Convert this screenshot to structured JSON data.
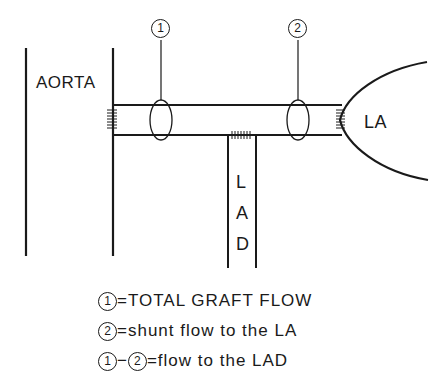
{
  "diagram": {
    "labels": {
      "aorta": "AORTA",
      "la": "LA",
      "lad_letters": [
        "L",
        "A",
        "D"
      ],
      "probe_1": "1",
      "probe_2": "2"
    },
    "legend": [
      {
        "marker": "1",
        "text": "=TOTAL GRAFT FLOW"
      },
      {
        "marker": "2",
        "text": "=shunt flow to the LA"
      },
      {
        "marker_a": "1",
        "op": "−",
        "marker_b": "2",
        "text": "=flow to the LAD"
      }
    ],
    "colors": {
      "line": "#1a1a1a",
      "background": "#ffffff"
    }
  }
}
